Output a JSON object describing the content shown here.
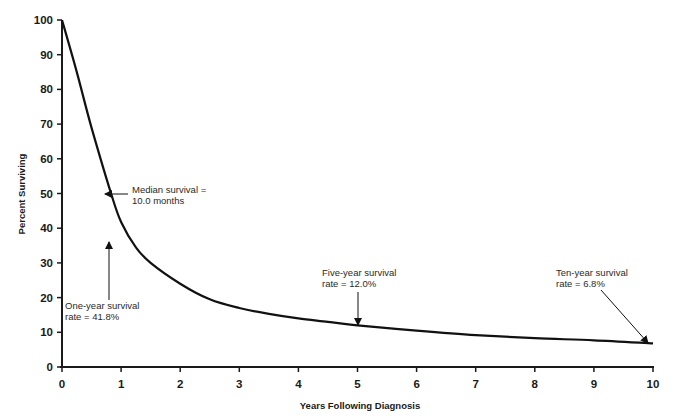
{
  "chart_data": {
    "type": "line",
    "title": "",
    "xlabel": "Years Following Diagnosis",
    "ylabel": "Percent Surviving",
    "xlim": [
      0,
      10
    ],
    "ylim": [
      0,
      100
    ],
    "x_ticks": [
      0,
      1,
      2,
      3,
      4,
      5,
      6,
      7,
      8,
      9,
      10
    ],
    "y_ticks": [
      0,
      10,
      20,
      30,
      40,
      50,
      60,
      70,
      80,
      90,
      100
    ],
    "grid": false,
    "legend": null,
    "series": [
      {
        "name": "Survival",
        "x": [
          0,
          0.25,
          0.5,
          0.83,
          1,
          1.25,
          1.5,
          2,
          2.5,
          3,
          3.5,
          4,
          4.5,
          5,
          6,
          7,
          8,
          9,
          10
        ],
        "values": [
          100,
          85,
          69,
          50,
          41.8,
          34.5,
          30,
          24,
          19.5,
          17,
          15.3,
          14,
          13,
          12,
          10.5,
          9.2,
          8.3,
          7.7,
          6.8
        ]
      }
    ],
    "annotations": [
      {
        "id": "median",
        "line1": "Median survival =",
        "line2": "10.0  months",
        "x": 0.83,
        "y": 50,
        "arrow": "left"
      },
      {
        "id": "one-year",
        "line1": "One-year survival",
        "line2": "rate = 41.8%",
        "x": 1,
        "y": 41.8,
        "arrow": "up"
      },
      {
        "id": "five-year",
        "line1": "Five-year survival",
        "line2": "rate = 12.0%",
        "x": 5,
        "y": 12,
        "arrow": "down"
      },
      {
        "id": "ten-year",
        "line1": "Ten-year survival",
        "line2": "rate = 6.8%",
        "x": 10,
        "y": 6.8,
        "arrow": "diagonal"
      }
    ]
  },
  "axes": {
    "x_title": "Years Following Diagnosis",
    "y_title": "Percent Surviving",
    "x_tick_labels": [
      "0",
      "1",
      "2",
      "3",
      "4",
      "5",
      "6",
      "7",
      "8",
      "9",
      "10"
    ],
    "y_tick_labels": [
      "0",
      "10",
      "20",
      "30",
      "40",
      "50",
      "60",
      "70",
      "80",
      "90",
      "100"
    ]
  },
  "annotations": {
    "median": {
      "line1": "Median survival =",
      "line2": "10.0  months"
    },
    "one_year": {
      "line1": "One-year survival",
      "line2": "rate = 41.8%"
    },
    "five_year": {
      "line1": "Five-year survival",
      "line2": "rate = 12.0%"
    },
    "ten_year": {
      "line1": "Ten-year survival",
      "line2": "rate = 6.8%"
    }
  },
  "colors": {
    "line": "#111111",
    "axis": "#1a1a1a",
    "text": "#2a2a2a",
    "background": "#ffffff"
  }
}
